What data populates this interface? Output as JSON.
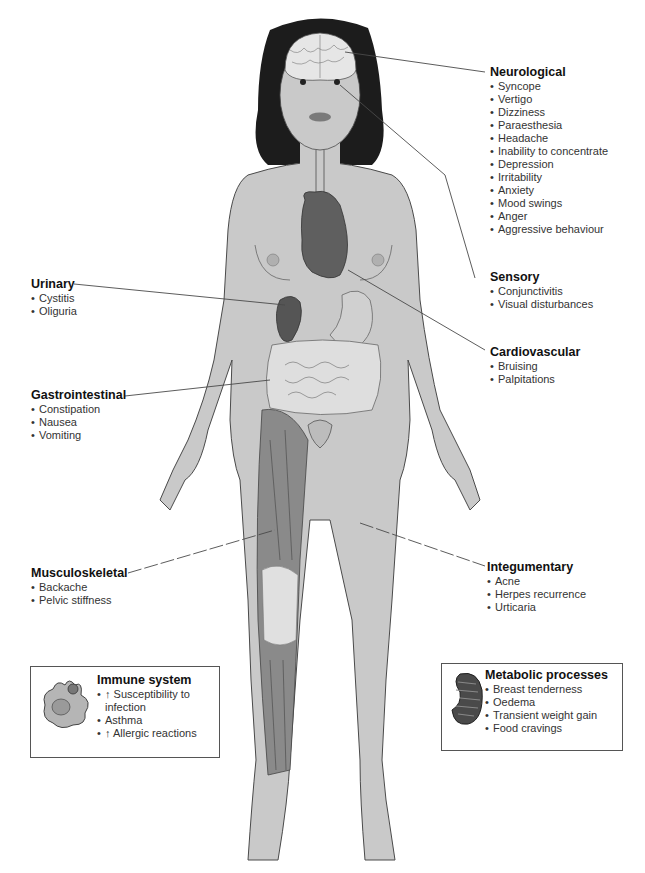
{
  "figure": {
    "type": "anatomical-diagram",
    "colors": {
      "skin": "#c9c9c9",
      "hair": "#1c1c1c",
      "brain": "#e6e6e6",
      "organ_dark": "#5a5a5a",
      "muscle": "#8a8a8a",
      "intestine": "#dedede",
      "line": "#4a4a4a"
    }
  },
  "labels": {
    "neurological": {
      "title": "Neurological",
      "items": [
        "Syncope",
        "Vertigo",
        "Dizziness",
        "Paraesthesia",
        "Headache",
        "Inability to concentrate",
        "Depression",
        "Irritability",
        "Anxiety",
        "Mood swings",
        "Anger",
        "Aggressive behaviour"
      ]
    },
    "sensory": {
      "title": "Sensory",
      "items": [
        "Conjunctivitis",
        "Visual disturbances"
      ]
    },
    "cardiovascular": {
      "title": "Cardiovascular",
      "items": [
        "Bruising",
        "Palpitations"
      ]
    },
    "urinary": {
      "title": "Urinary",
      "items": [
        "Cystitis",
        "Oliguria"
      ]
    },
    "gastrointestinal": {
      "title": "Gastrointestinal",
      "items": [
        "Constipation",
        "Nausea",
        "Vomiting"
      ]
    },
    "musculoskeletal": {
      "title": "Musculoskeletal",
      "items": [
        "Backache",
        "Pelvic stiffness"
      ]
    },
    "integumentary": {
      "title": "Integumentary",
      "items": [
        "Acne",
        "Herpes recurrence",
        "Urticaria"
      ]
    },
    "immune": {
      "title": "Immune system",
      "items": [
        "↑ Susceptibility to infection",
        "Asthma",
        "↑ Allergic reactions"
      ],
      "icon": "immune-cell-icon"
    },
    "metabolic": {
      "title": "Metabolic processes",
      "items": [
        "Breast tenderness",
        "Oedema",
        "Transient weight gain",
        "Food cravings"
      ],
      "icon": "mitochondrion-icon"
    }
  }
}
